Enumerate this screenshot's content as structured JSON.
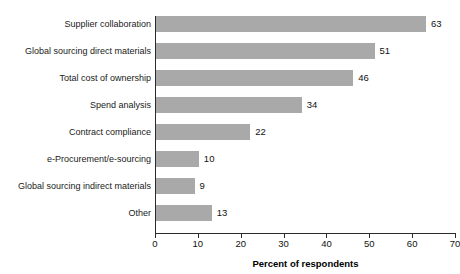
{
  "top_clipped_text": "",
  "chart_data": {
    "type": "bar",
    "orientation": "horizontal",
    "title": "",
    "subtitle": "",
    "xlabel": "Percent of respondents",
    "ylabel": "",
    "categories": [
      "Supplier collaboration",
      "Global sourcing direct materials",
      "Total cost of ownership",
      "Spend analysis",
      "Contract compliance",
      "e-Procurement/e-sourcing",
      "Global sourcing indirect materials",
      "Other"
    ],
    "values": [
      63,
      51,
      46,
      34,
      22,
      10,
      9,
      13
    ],
    "value_labels": [
      "63",
      "51",
      "46",
      "34",
      "22",
      "10",
      "9",
      "13"
    ],
    "xlim": [
      0,
      70
    ],
    "xticks": [
      0,
      10,
      20,
      30,
      40,
      50,
      60,
      70
    ],
    "xtick_labels": [
      "0",
      "10",
      "20",
      "30",
      "40",
      "50",
      "60",
      "70"
    ],
    "grid": false,
    "legend": null,
    "bar_color": "#a9a9a9",
    "axis_color": "#2b2b2b",
    "background_color": "#ffffff",
    "units": "percent"
  }
}
